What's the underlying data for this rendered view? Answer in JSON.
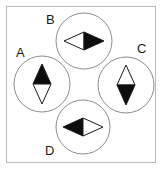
{
  "figure": {
    "title": "",
    "width": 163,
    "height": 171,
    "background_color": "#ffffff",
    "frame": {
      "stroke_color": "#b9b9b9",
      "stroke_width": 1,
      "x": 6,
      "y": 6,
      "width": 150,
      "height": 157
    },
    "style": {
      "circle_stroke_color": "#8c8c8c",
      "circle_stroke_width": 1,
      "circle_fill": "#ffffff",
      "marker_fill_dark": "#0d0d0d",
      "marker_fill_light": "#ffffff",
      "marker_stroke_color": "#1a1a1a",
      "label_color": "#1a1a1a"
    },
    "layout": "diamond-arrangement-of-four-circles",
    "nodes": [
      {
        "id": "A",
        "label": "A",
        "label_position": "upper-left",
        "circle": {
          "cx": 42,
          "cy": 84,
          "r": 28
        },
        "marker": {
          "shape": "diamond",
          "orientation": "vertical",
          "pointing": "up",
          "half_width": 9,
          "half_height": 20,
          "filled_half": "top",
          "filled_color": "#0d0d0d",
          "open_color": "#ffffff"
        }
      },
      {
        "id": "B",
        "label": "B",
        "label_position": "upper-left",
        "circle": {
          "cx": 84,
          "cy": 41,
          "r": 28
        },
        "marker": {
          "shape": "diamond",
          "orientation": "horizontal",
          "pointing": "right",
          "half_width": 20,
          "half_height": 9,
          "filled_half": "right",
          "filled_color": "#0d0d0d",
          "open_color": "#ffffff"
        }
      },
      {
        "id": "C",
        "label": "C",
        "label_position": "upper-right",
        "circle": {
          "cx": 126,
          "cy": 85,
          "r": 28
        },
        "marker": {
          "shape": "diamond",
          "orientation": "vertical",
          "pointing": "down",
          "half_width": 9,
          "half_height": 20,
          "filled_half": "bottom",
          "filled_color": "#0d0d0d",
          "open_color": "#ffffff"
        }
      },
      {
        "id": "D",
        "label": "D",
        "label_position": "lower-left",
        "circle": {
          "cx": 83,
          "cy": 127,
          "r": 27
        },
        "marker": {
          "shape": "diamond",
          "orientation": "horizontal",
          "pointing": "left",
          "half_width": 20,
          "half_height": 9,
          "filled_half": "left",
          "filled_color": "#0d0d0d",
          "open_color": "#ffffff"
        }
      }
    ]
  }
}
